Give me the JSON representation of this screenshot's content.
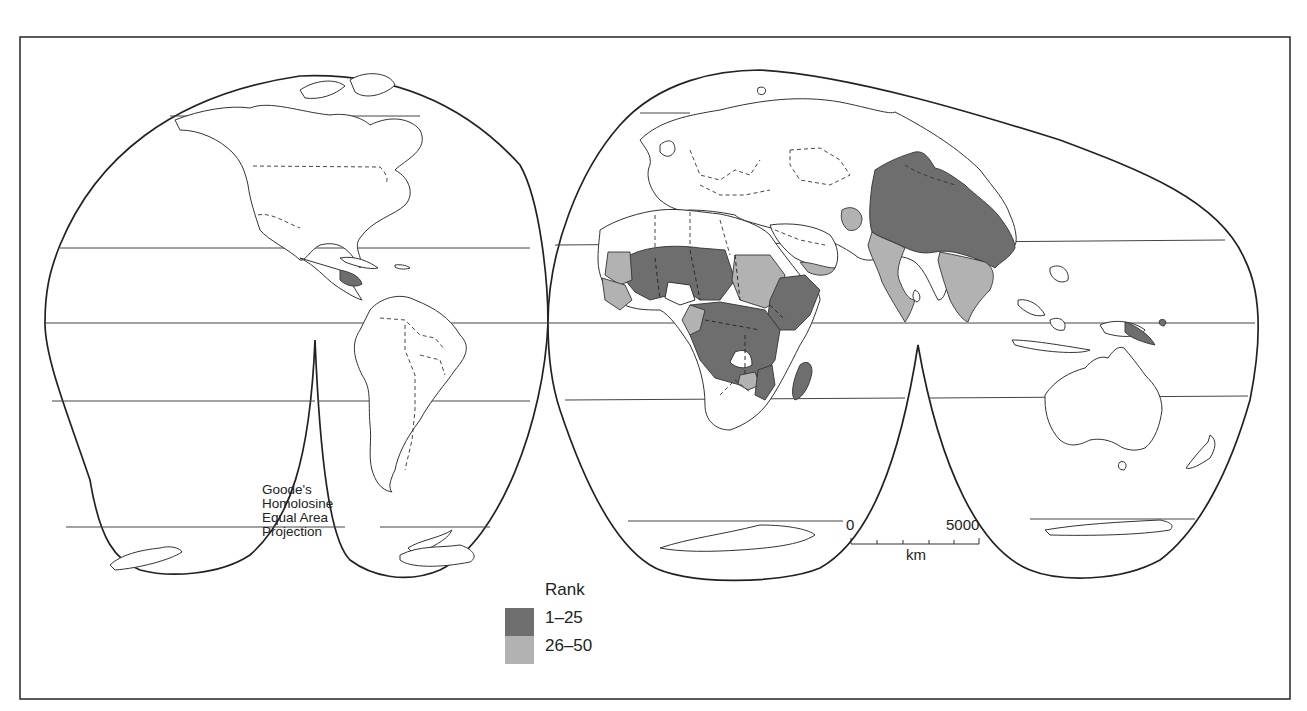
{
  "map": {
    "projection_label": [
      "Goode's",
      "Homolosine",
      "Equal Area",
      "Projection"
    ],
    "legend": {
      "title": "Rank",
      "classes": [
        {
          "label": "1–25",
          "color": "#6e6e6e"
        },
        {
          "label": "26–50",
          "color": "#b2b2b2"
        }
      ]
    },
    "scale_bar": {
      "start_label": "0",
      "end_label": "5000",
      "unit": "km",
      "ticks": 5
    },
    "shaded_regions": {
      "rank_1_25": [
        "West/Central Africa (Sahel)",
        "Central Africa",
        "East Africa (Ethiopia, Kenya, Tanzania)",
        "Mozambique",
        "Madagascar",
        "China",
        "Papua New Guinea",
        "Central America (Honduras/Nicaragua)"
      ],
      "rank_26_50": [
        "Mauritania",
        "Sudan",
        "Yemen",
        "India",
        "Southeast Asia",
        "Afghanistan",
        "Coastal West Africa",
        "Zimbabwe"
      ]
    }
  }
}
